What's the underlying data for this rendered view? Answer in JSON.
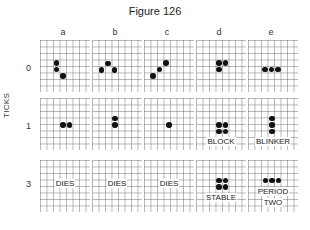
{
  "figure": {
    "title": "Figure 126",
    "y_axis_title": "TICKS",
    "columns": [
      "a",
      "b",
      "c",
      "d",
      "e"
    ],
    "rows": [
      "0",
      "1",
      "3"
    ],
    "panels": {
      "row0": [
        {
          "col": "a",
          "cells": [
            [
              2,
              3
            ],
            [
              2,
              4
            ],
            [
              3,
              5
            ]
          ],
          "caption": ""
        },
        {
          "col": "b",
          "cells": [
            [
              1,
              4
            ],
            [
              2,
              3
            ],
            [
              3,
              4
            ]
          ],
          "caption": ""
        },
        {
          "col": "c",
          "cells": [
            [
              1,
              5
            ],
            [
              2,
              4
            ],
            [
              3,
              3
            ]
          ],
          "caption": ""
        },
        {
          "col": "d",
          "cells": [
            [
              2,
              3
            ],
            [
              3,
              3
            ],
            [
              2,
              4
            ]
          ],
          "caption": ""
        },
        {
          "col": "e",
          "cells": [
            [
              2,
              4
            ],
            [
              3,
              4
            ],
            [
              4,
              4
            ]
          ],
          "caption": ""
        }
      ],
      "row1": [
        {
          "col": "a",
          "cells": [
            [
              2,
              3
            ],
            [
              3,
              3
            ]
          ],
          "caption": ""
        },
        {
          "col": "b",
          "cells": [
            [
              2,
              2
            ],
            [
              2,
              3
            ]
          ],
          "caption": ""
        },
        {
          "col": "c",
          "cells": [
            [
              2,
              3
            ]
          ],
          "caption": ""
        },
        {
          "col": "d",
          "cells": [
            [
              2,
              3
            ],
            [
              3,
              3
            ],
            [
              2,
              4
            ],
            [
              3,
              4
            ]
          ],
          "caption": "BLOCK"
        },
        {
          "col": "e",
          "cells": [
            [
              3,
              2
            ],
            [
              3,
              3
            ],
            [
              3,
              4
            ]
          ],
          "caption": "BLINKER"
        }
      ],
      "row3": [
        {
          "col": "a",
          "cells": [],
          "caption": "DIES"
        },
        {
          "col": "b",
          "cells": [],
          "caption": "DIES"
        },
        {
          "col": "c",
          "cells": [],
          "caption": "DIES"
        },
        {
          "col": "d",
          "cells": [
            [
              2,
              2
            ],
            [
              3,
              2
            ],
            [
              2,
              3
            ],
            [
              3,
              3
            ]
          ],
          "caption": "STABLE"
        },
        {
          "col": "e",
          "cells": [
            [
              2,
              2
            ],
            [
              3,
              2
            ],
            [
              4,
              2
            ]
          ],
          "caption": "PERIOD TWO"
        }
      ]
    },
    "captions": {
      "row1_d": "BLOCK",
      "row1_e": "BLINKER",
      "row3_a": "DIES",
      "row3_b": "DIES",
      "row3_c": "DIES",
      "row3_d": "STABLE",
      "row3_e_line1": "PERIOD",
      "row3_e_line2": "TWO"
    }
  }
}
